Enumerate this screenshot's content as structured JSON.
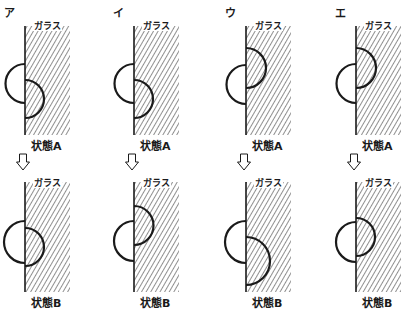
{
  "diagram": {
    "glass_label": "ガラス",
    "state_a_label": "状態A",
    "state_b_label": "状態B",
    "colors": {
      "stroke": "#1a1a1a",
      "hatch": "#333333",
      "background": "#ffffff"
    },
    "panels": [
      {
        "label": "ア",
        "glass_x": 25,
        "state_a": {
          "outside_arc": [
            64,
            103
          ],
          "inside_arc": [
            80,
            118
          ]
        },
        "state_b": {
          "outside_arc": [
            221,
            263
          ],
          "inside_arc": [
            228,
            266
          ]
        }
      },
      {
        "label": "イ",
        "glass_x": 134,
        "state_a": {
          "outside_arc": [
            64,
            103
          ],
          "inside_arc": [
            80,
            118
          ]
        },
        "state_b": {
          "outside_arc": [
            221,
            261
          ],
          "inside_arc": [
            206,
            245
          ]
        }
      },
      {
        "label": "ウ",
        "glass_x": 246,
        "state_a": {
          "outside_arc": [
            65,
            104
          ],
          "inside_arc": [
            48,
            88
          ]
        },
        "state_b": {
          "outside_arc": [
            221,
            263
          ],
          "inside_arc": [
            237,
            285
          ]
        }
      },
      {
        "label": "エ",
        "glass_x": 356,
        "state_a": {
          "outside_arc": [
            64,
            103
          ],
          "inside_arc": [
            48,
            88
          ]
        },
        "state_b": {
          "outside_arc": [
            222,
            262
          ],
          "inside_arc": [
            218,
            256
          ]
        }
      }
    ]
  }
}
